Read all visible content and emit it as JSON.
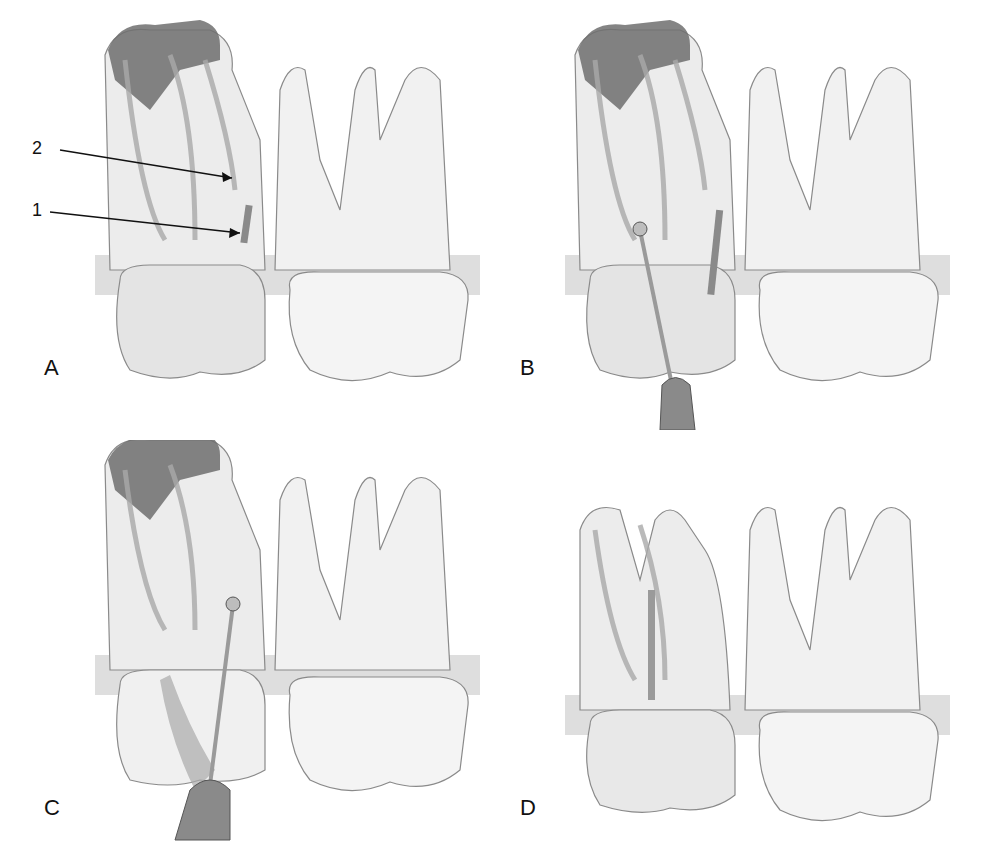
{
  "figure": {
    "panels": [
      {
        "id": "A",
        "label": "A",
        "instrument": false,
        "post": false,
        "callouts": [
          {
            "number": "2",
            "target": "canal"
          },
          {
            "number": "1",
            "target": "separated-instrument"
          }
        ]
      },
      {
        "id": "B",
        "label": "B",
        "instrument": true,
        "post": false,
        "callouts": []
      },
      {
        "id": "C",
        "label": "C",
        "instrument": true,
        "post": false,
        "callouts": []
      },
      {
        "id": "D",
        "label": "D",
        "instrument": false,
        "post": true,
        "callouts": []
      }
    ],
    "colors": {
      "tooth_fill": "#f1f1f1",
      "tooth_stroke": "#8a8a8a",
      "canal": "#a9a9a9",
      "decay": "#6f6f6f",
      "bone_band": "#cfcfcf",
      "instrument": "#9a9a9a",
      "label": "#111111"
    }
  }
}
